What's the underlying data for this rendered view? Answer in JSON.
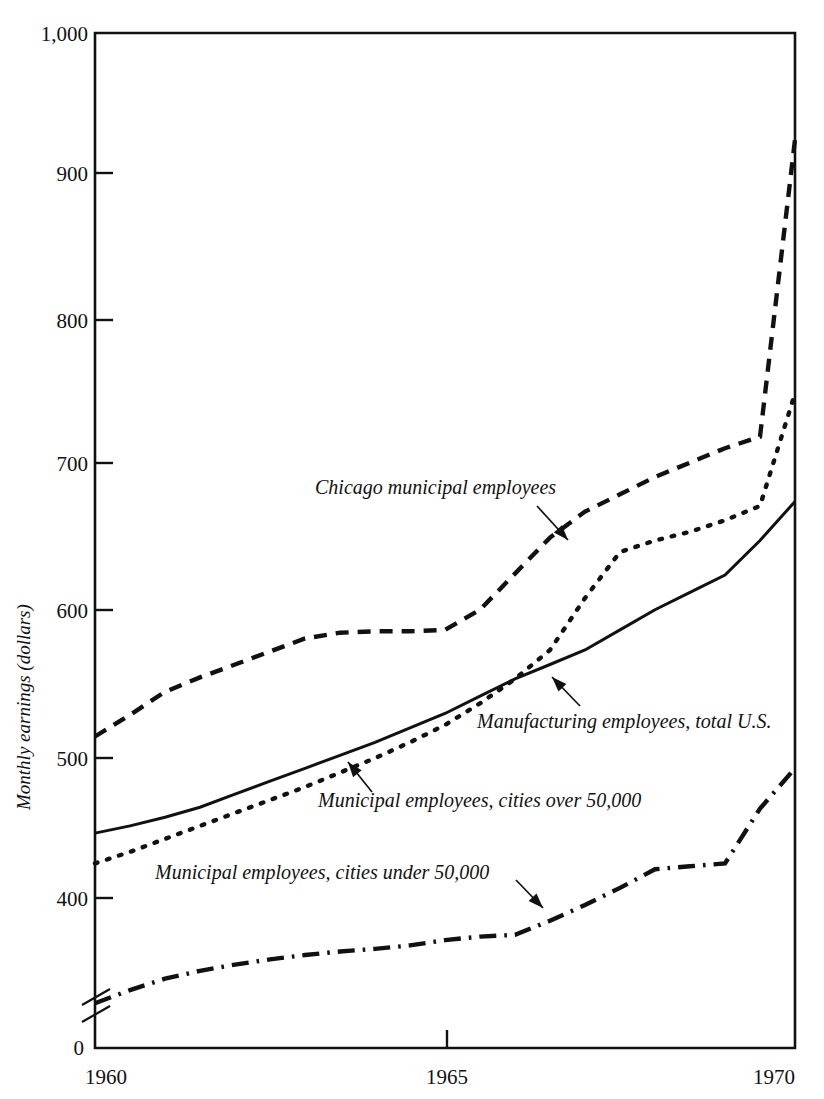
{
  "chart_data": {
    "type": "line",
    "title": "",
    "xlabel": "",
    "ylabel": "Monthly earnings (dollars)",
    "xlim": [
      1960,
      1970
    ],
    "ylim": [
      0,
      1000
    ],
    "y_axis_break": true,
    "y_axis_break_note": "axis broken between 0 and about 390",
    "grid": false,
    "legend_position": "inline-annotations",
    "xticks": [
      "1960",
      "1965",
      "1970"
    ],
    "yticks": [
      "0",
      "400",
      "500",
      "600",
      "700",
      "800",
      "900",
      "1,000"
    ],
    "x": [
      1960,
      1960.5,
      1961,
      1961.5,
      1962,
      1962.5,
      1963,
      1963.5,
      1964,
      1964.5,
      1965,
      1965.5,
      1966,
      1966.5,
      1967,
      1967.5,
      1968,
      1968.5,
      1969,
      1969.5,
      1970
    ],
    "series": [
      {
        "name": "Chicago municipal employees",
        "style": "dashed",
        "values": [
          512,
          527,
          543,
          553,
          562,
          571,
          580,
          584,
          585,
          585,
          586,
          600,
          625,
          650,
          668,
          680,
          692,
          702,
          712,
          720,
          926
        ]
      },
      {
        "name": "Manufacturing employees, total U.S.",
        "style": "solid",
        "values": [
          445,
          450,
          456,
          463,
          472,
          481,
          490,
          499,
          508,
          518,
          528,
          540,
          552,
          562,
          572,
          586,
          600,
          612,
          624,
          648,
          675
        ]
      },
      {
        "name": "Municipal employees, cities over 50,000",
        "style": "dotted",
        "values": [
          424,
          432,
          441,
          450,
          459,
          468,
          477,
          487,
          497,
          508,
          520,
          535,
          552,
          572,
          608,
          640,
          648,
          654,
          662,
          672,
          750
        ]
      },
      {
        "name": "Municipal employees, cities under 50,000",
        "style": "dashdot",
        "values": [
          280,
          295,
          308,
          317,
          324,
          330,
          335,
          339,
          342,
          346,
          352,
          356,
          358,
          374,
          392,
          407,
          420,
          422,
          424,
          462,
          490
        ]
      }
    ],
    "annotations": [
      {
        "name": "chicago-label",
        "text": "Chicago municipal employees",
        "text_x": 315,
        "text_y": 494,
        "arrow_from_x": 537,
        "arrow_from_y": 506,
        "arrow_to_x": 568,
        "arrow_to_y": 540
      },
      {
        "name": "manufacturing-label",
        "text": "Manufacturing employees, total U.S.",
        "text_x": 477,
        "text_y": 728,
        "arrow_from_x": 580,
        "arrow_from_y": 706,
        "arrow_to_x": 552,
        "arrow_to_y": 677
      },
      {
        "name": "over-50000-label",
        "text": "Municipal employees, cities over 50,000",
        "text_x": 318,
        "text_y": 807,
        "arrow_from_x": 372,
        "arrow_from_y": 792,
        "arrow_to_x": 348,
        "arrow_to_y": 762
      },
      {
        "name": "under-50000-label",
        "text": "Municipal employees, cities under 50,000",
        "text_x": 155,
        "text_y": 879,
        "arrow_from_x": 516,
        "arrow_from_y": 880,
        "arrow_to_x": 543,
        "arrow_to_y": 908
      }
    ]
  },
  "axes": {
    "y_title": "Monthly earnings (dollars)",
    "y_labels": [
      {
        "value": "1,000",
        "y": 33
      },
      {
        "value": "900",
        "y": 173
      },
      {
        "value": "800",
        "y": 320
      },
      {
        "value": "700",
        "y": 463
      },
      {
        "value": "600",
        "y": 610
      },
      {
        "value": "500",
        "y": 758
      },
      {
        "value": "400",
        "y": 898
      },
      {
        "value": "0",
        "y": 1047
      }
    ],
    "x_labels": [
      {
        "value": "1960",
        "x": 85
      },
      {
        "value": "1965",
        "x": 447
      },
      {
        "value": "1970",
        "x": 795
      }
    ]
  }
}
